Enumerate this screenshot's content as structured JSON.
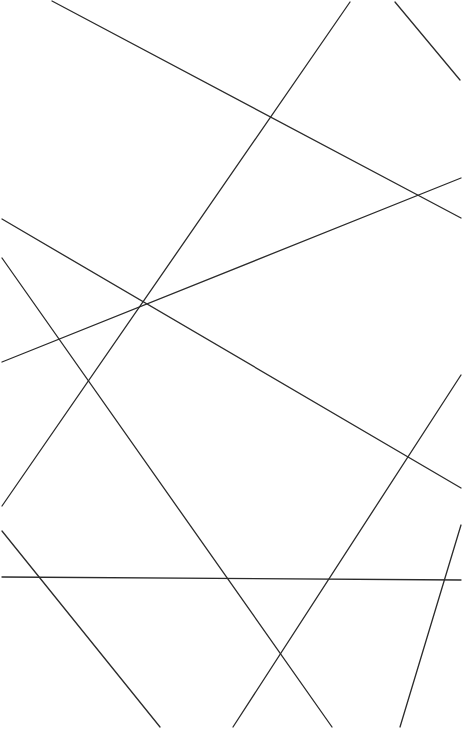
{
  "canvas": {
    "width": 463,
    "height": 729,
    "background": "#ffffff",
    "stroke_color": "#2b2b2b",
    "stroke_width": 1.3
  },
  "lines": [
    {
      "x1": 52,
      "y1": 1,
      "x2": 461,
      "y2": 218
    },
    {
      "x1": 350,
      "y1": 2,
      "x2": 2,
      "y2": 506
    },
    {
      "x1": 395,
      "y1": 2,
      "x2": 460,
      "y2": 80
    },
    {
      "x1": 2,
      "y1": 219,
      "x2": 461,
      "y2": 488
    },
    {
      "x1": 2,
      "y1": 362,
      "x2": 461,
      "y2": 178
    },
    {
      "x1": 2,
      "y1": 258,
      "x2": 332,
      "y2": 727
    },
    {
      "x1": 461,
      "y1": 375,
      "x2": 233,
      "y2": 727
    },
    {
      "x1": 2,
      "y1": 531,
      "x2": 160,
      "y2": 727
    },
    {
      "x1": 2,
      "y1": 577,
      "x2": 461,
      "y2": 580
    },
    {
      "x1": 461,
      "y1": 525,
      "x2": 400,
      "y2": 727
    }
  ]
}
